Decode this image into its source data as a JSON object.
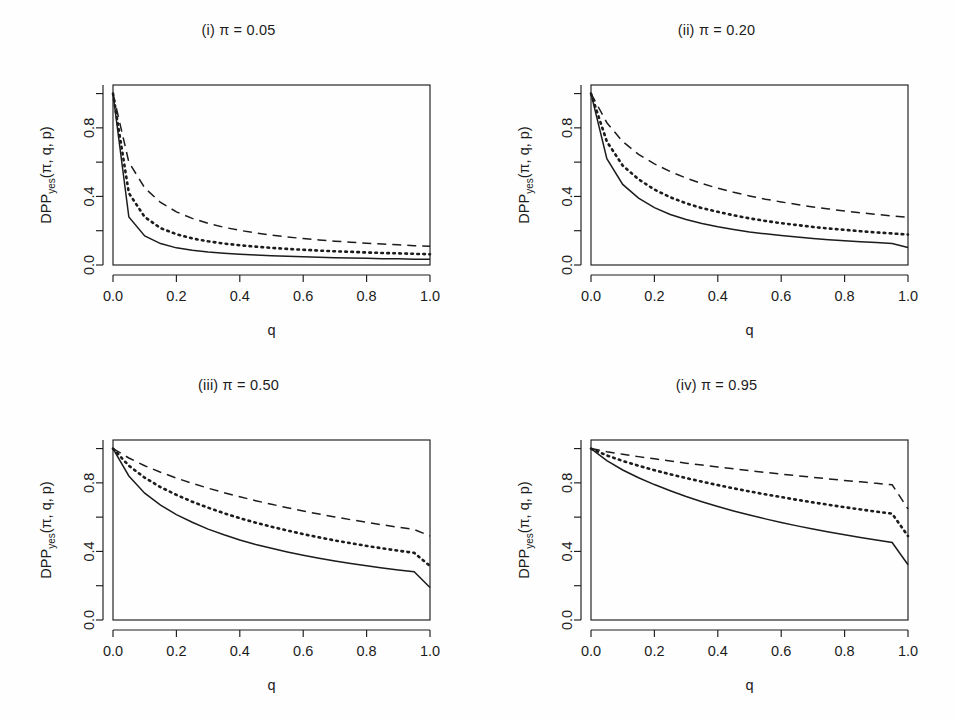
{
  "figure": {
    "background_color": "#fefefe",
    "line_color": "#1c1c1c",
    "panel_layout": "2x2",
    "ylabel": "DPP",
    "ylabel_sub": "yes",
    "ylabel_args": "(π, q, p)",
    "xlabel": "q"
  },
  "axes": {
    "x_ticks": [
      "0.0",
      "0.2",
      "0.4",
      "0.6",
      "0.8",
      "1.0"
    ],
    "x_tick_values": [
      0.0,
      0.2,
      0.4,
      0.6,
      0.8,
      1.0
    ],
    "x_minor_values": [
      0.1,
      0.3,
      0.5,
      0.7,
      0.9
    ],
    "y_ticks": [
      "0.0",
      "0.4",
      "0.8"
    ],
    "y_tick_values": [
      0.0,
      0.4,
      0.8
    ],
    "y_minor_values": [
      0.2,
      0.6,
      1.0
    ],
    "xlim": [
      0.0,
      1.0
    ],
    "ylim": [
      0.0,
      1.05
    ]
  },
  "chart_data": {
    "type": "line",
    "title": "",
    "xlabel": "q",
    "ylabel": "DPP_yes(π, q, p)",
    "xlim": [
      0.0,
      1.0
    ],
    "ylim": [
      0.0,
      1.05
    ],
    "grid": false,
    "legend": "none",
    "x": [
      0.0,
      0.05,
      0.1,
      0.15,
      0.2,
      0.25,
      0.3,
      0.35,
      0.4,
      0.45,
      0.5,
      0.55,
      0.6,
      0.65,
      0.7,
      0.75,
      0.8,
      0.85,
      0.9,
      0.95,
      1.0
    ],
    "panels": [
      {
        "id": "i",
        "label": "(i) π = 0.05",
        "pi": 0.05,
        "series": [
          {
            "name": "solid",
            "linetype": "solid",
            "values": [
              1.0,
              0.28,
              0.17,
              0.125,
              0.1,
              0.086,
              0.076,
              0.069,
              0.063,
              0.058,
              0.054,
              0.051,
              0.048,
              0.045,
              0.043,
              0.041,
              0.039,
              0.037,
              0.036,
              0.034,
              0.033
            ]
          },
          {
            "name": "dotted",
            "linetype": "dotted",
            "values": [
              1.0,
              0.42,
              0.28,
              0.215,
              0.18,
              0.155,
              0.138,
              0.125,
              0.115,
              0.107,
              0.1,
              0.094,
              0.089,
              0.084,
              0.08,
              0.077,
              0.073,
              0.07,
              0.068,
              0.065,
              0.063
            ]
          },
          {
            "name": "dashed",
            "linetype": "dashed",
            "values": [
              1.0,
              0.6,
              0.45,
              0.365,
              0.31,
              0.272,
              0.243,
              0.22,
              0.202,
              0.187,
              0.174,
              0.164,
              0.154,
              0.146,
              0.139,
              0.133,
              0.127,
              0.122,
              0.118,
              0.113,
              0.11
            ]
          }
        ]
      },
      {
        "id": "ii",
        "label": "(ii) π = 0.20",
        "pi": 0.2,
        "series": [
          {
            "name": "solid",
            "linetype": "solid",
            "values": [
              1.0,
              0.62,
              0.47,
              0.39,
              0.335,
              0.295,
              0.265,
              0.242,
              0.223,
              0.207,
              0.193,
              0.182,
              0.172,
              0.163,
              0.155,
              0.148,
              0.142,
              0.136,
              0.131,
              0.126,
              0.102
            ]
          },
          {
            "name": "dotted",
            "linetype": "dotted",
            "values": [
              1.0,
              0.72,
              0.58,
              0.5,
              0.44,
              0.395,
              0.36,
              0.332,
              0.31,
              0.29,
              0.272,
              0.257,
              0.244,
              0.233,
              0.222,
              0.213,
              0.205,
              0.197,
              0.19,
              0.184,
              0.178
            ]
          },
          {
            "name": "dashed",
            "linetype": "dashed",
            "values": [
              1.0,
              0.83,
              0.72,
              0.645,
              0.59,
              0.545,
              0.507,
              0.475,
              0.448,
              0.424,
              0.403,
              0.384,
              0.368,
              0.353,
              0.339,
              0.327,
              0.315,
              0.305,
              0.295,
              0.286,
              0.278
            ]
          }
        ]
      },
      {
        "id": "iii",
        "label": "(iii) π = 0.50",
        "pi": 0.5,
        "series": [
          {
            "name": "solid",
            "linetype": "solid",
            "values": [
              1.0,
              0.84,
              0.74,
              0.67,
              0.615,
              0.57,
              0.53,
              0.497,
              0.467,
              0.441,
              0.418,
              0.397,
              0.378,
              0.36,
              0.344,
              0.33,
              0.316,
              0.303,
              0.292,
              0.281,
              0.19
            ]
          },
          {
            "name": "dotted",
            "linetype": "dotted",
            "values": [
              1.0,
              0.9,
              0.83,
              0.775,
              0.73,
              0.69,
              0.655,
              0.623,
              0.594,
              0.568,
              0.544,
              0.522,
              0.501,
              0.482,
              0.464,
              0.448,
              0.432,
              0.418,
              0.404,
              0.392,
              0.315
            ]
          },
          {
            "name": "dashed",
            "linetype": "dashed",
            "values": [
              1.0,
              0.945,
              0.9,
              0.862,
              0.828,
              0.797,
              0.769,
              0.743,
              0.719,
              0.696,
              0.675,
              0.655,
              0.636,
              0.618,
              0.601,
              0.585,
              0.57,
              0.555,
              0.541,
              0.528,
              0.49
            ]
          }
        ]
      },
      {
        "id": "iv",
        "label": "(iv) π = 0.95",
        "pi": 0.95,
        "series": [
          {
            "name": "solid",
            "linetype": "solid",
            "values": [
              1.0,
              0.93,
              0.875,
              0.83,
              0.79,
              0.754,
              0.72,
              0.69,
              0.662,
              0.636,
              0.612,
              0.59,
              0.569,
              0.549,
              0.531,
              0.513,
              0.497,
              0.481,
              0.466,
              0.452,
              0.322
            ]
          },
          {
            "name": "dotted",
            "linetype": "dotted",
            "values": [
              1.0,
              0.96,
              0.928,
              0.9,
              0.874,
              0.85,
              0.828,
              0.807,
              0.787,
              0.768,
              0.75,
              0.733,
              0.717,
              0.701,
              0.686,
              0.672,
              0.658,
              0.645,
              0.632,
              0.62,
              0.49
            ]
          },
          {
            "name": "dashed",
            "linetype": "dashed",
            "values": [
              1.0,
              0.982,
              0.967,
              0.953,
              0.94,
              0.927,
              0.915,
              0.904,
              0.893,
              0.882,
              0.871,
              0.861,
              0.851,
              0.842,
              0.832,
              0.823,
              0.814,
              0.806,
              0.797,
              0.789,
              0.648
            ]
          }
        ]
      }
    ]
  }
}
